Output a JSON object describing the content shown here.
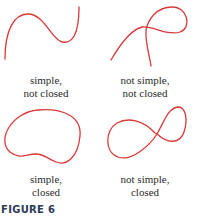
{
  "figure": {
    "label": "FIGURE 6",
    "curve_color": "#d83a3a",
    "panels": [
      {
        "id": "simple-not-closed",
        "line1": "simple,",
        "line2": "not closed",
        "simple": true,
        "closed": false
      },
      {
        "id": "not-simple-not-closed",
        "line1": "not simple,",
        "line2": "not closed",
        "simple": false,
        "closed": false
      },
      {
        "id": "simple-closed",
        "line1": "simple,",
        "line2": "closed",
        "simple": true,
        "closed": true
      },
      {
        "id": "not-simple-closed",
        "line1": "not simple,",
        "line2": "closed",
        "simple": false,
        "closed": true
      }
    ]
  }
}
